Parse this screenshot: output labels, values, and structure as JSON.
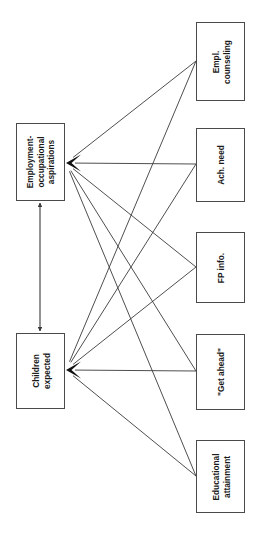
{
  "diagram": {
    "type": "path-model-diagram",
    "orientation": "rotated-90-ccw",
    "background_color": "#ffffff",
    "line_color": "#3a3a3a",
    "box_border_color": "#4a4a4a",
    "text_color": "#1a1a1a",
    "nodes": [
      {
        "id": "empl-counseling",
        "label": "Empl.\ncounseling",
        "column": "right",
        "x": 196,
        "y": 22,
        "w": 49,
        "h": 79,
        "port_x": 196,
        "port_y": 61
      },
      {
        "id": "ach-need",
        "label": "Ach. need",
        "column": "right",
        "x": 196,
        "y": 128,
        "w": 49,
        "h": 74,
        "port_x": 196,
        "port_y": 164
      },
      {
        "id": "fp-info",
        "label": "FP info.",
        "column": "right",
        "x": 196,
        "y": 232,
        "w": 49,
        "h": 71,
        "port_x": 196,
        "port_y": 267
      },
      {
        "id": "get-ahead",
        "label": "\"Get ahead\"",
        "column": "right",
        "x": 196,
        "y": 334,
        "w": 49,
        "h": 76,
        "port_x": 196,
        "port_y": 371
      },
      {
        "id": "educational-attainment",
        "label": "Educational\nattainment",
        "column": "right",
        "x": 196,
        "y": 440,
        "w": 49,
        "h": 73,
        "port_x": 196,
        "port_y": 476
      },
      {
        "id": "employment-occupational-aspirations",
        "label": "Employment-\noccupational\naspirations",
        "column": "left",
        "x": 16,
        "y": 123,
        "w": 49,
        "h": 78,
        "port_x": 66,
        "port_y": 163
      },
      {
        "id": "children-expected",
        "label": "Children\nexpected",
        "column": "left",
        "x": 16,
        "y": 333,
        "w": 49,
        "h": 76,
        "port_x": 66,
        "port_y": 370
      }
    ],
    "edges": [
      {
        "id": "edge-empl-counseling-to-aspirations",
        "from": "empl-counseling",
        "to": "employment-occupational-aspirations",
        "arrow_at": "to",
        "x1": 196,
        "y1": 61,
        "x2": 66,
        "y2": 163
      },
      {
        "id": "edge-ach-need-to-aspirations",
        "from": "ach-need",
        "to": "employment-occupational-aspirations",
        "arrow_at": "to",
        "x1": 196,
        "y1": 164,
        "x2": 66,
        "y2": 163
      },
      {
        "id": "edge-fp-info-to-aspirations",
        "from": "fp-info",
        "to": "employment-occupational-aspirations",
        "arrow_at": "to",
        "x1": 196,
        "y1": 267,
        "x2": 66,
        "y2": 163
      },
      {
        "id": "edge-get-ahead-to-aspirations",
        "from": "get-ahead",
        "to": "employment-occupational-aspirations",
        "arrow_at": "to",
        "x1": 196,
        "y1": 371,
        "x2": 66,
        "y2": 163
      },
      {
        "id": "edge-educational-attainment-to-aspirations",
        "from": "educational-attainment",
        "to": "employment-occupational-aspirations",
        "arrow_at": "to",
        "x1": 196,
        "y1": 476,
        "x2": 66,
        "y2": 163
      },
      {
        "id": "edge-empl-counseling-to-children",
        "from": "empl-counseling",
        "to": "children-expected",
        "arrow_at": "to",
        "x1": 196,
        "y1": 61,
        "x2": 66,
        "y2": 370
      },
      {
        "id": "edge-ach-need-to-children",
        "from": "ach-need",
        "to": "children-expected",
        "arrow_at": "to",
        "x1": 196,
        "y1": 164,
        "x2": 66,
        "y2": 370
      },
      {
        "id": "edge-fp-info-to-children",
        "from": "fp-info",
        "to": "children-expected",
        "arrow_at": "to",
        "x1": 196,
        "y1": 267,
        "x2": 66,
        "y2": 370
      },
      {
        "id": "edge-get-ahead-to-children",
        "from": "get-ahead",
        "to": "children-expected",
        "arrow_at": "to",
        "x1": 196,
        "y1": 371,
        "x2": 66,
        "y2": 370
      },
      {
        "id": "edge-educational-attainment-to-children",
        "from": "educational-attainment",
        "to": "children-expected",
        "arrow_at": "to",
        "x1": 196,
        "y1": 476,
        "x2": 66,
        "y2": 370
      }
    ],
    "bidirectional_edge": {
      "id": "edge-aspirations-children-bidirectional",
      "between": [
        "employment-occupational-aspirations",
        "children-expected"
      ],
      "x1": 40,
      "y1": 331,
      "x2": 40,
      "y2": 203
    }
  }
}
